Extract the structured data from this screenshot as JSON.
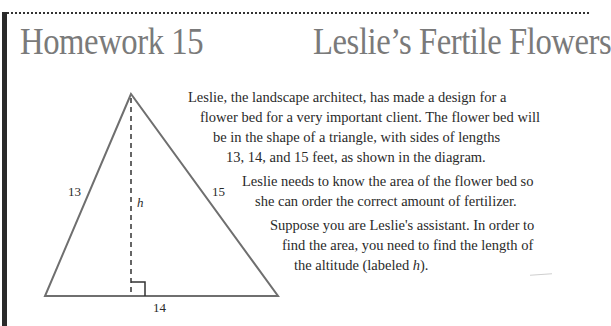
{
  "header": {
    "left_title": "Homework 15",
    "right_title": "Leslie’s Fertile Flowers"
  },
  "diagram": {
    "type": "triangle",
    "side_left_label": "13",
    "side_right_label": "15",
    "base_label": "14",
    "altitude_label": "h",
    "right_angle_marker": true
  },
  "paragraphs": [
    {
      "lines": [
        "Leslie, the landscape architect, has made a design for a",
        "flower bed for a very important client. The flower bed will",
        "be in the shape of a triangle, with sides of lengths",
        "13, 14, and 15 feet, as shown in the diagram."
      ]
    },
    {
      "lines": [
        "Leslie needs to know the area of the flower bed so",
        "she can order the correct amount of fertilizer."
      ]
    },
    {
      "lines": [
        "Suppose you are Leslie's assistant. In order to",
        "find the area, you need to find the length of",
        "the altitude (labeled ",
        "h",
        ")."
      ]
    }
  ],
  "colors": {
    "title": "#7a7a7a",
    "text": "#2a2a2a",
    "triangle_stroke": "#6f6f6f",
    "left_bar": "#2a2a2a"
  }
}
